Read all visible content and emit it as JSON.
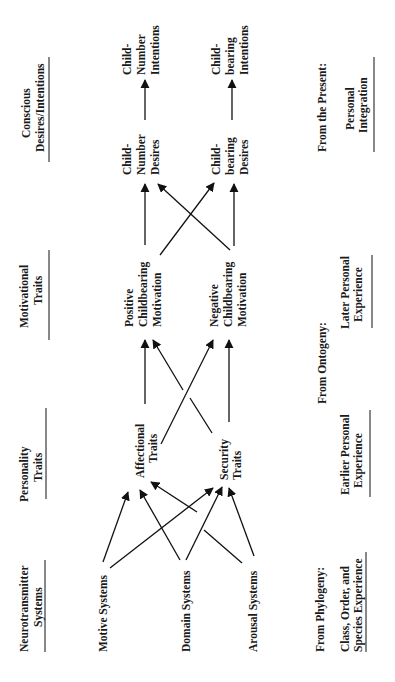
{
  "headers": {
    "neuro": [
      "Neurotransmitter",
      "Systems"
    ],
    "personality": [
      "Personality",
      "Traits"
    ],
    "motivational": [
      "Motivational",
      "Traits"
    ],
    "conscious": [
      "Conscious",
      "Desires/Intentions"
    ]
  },
  "nodes": {
    "motive": [
      "Motive Systems"
    ],
    "domain": [
      "Domain Systems"
    ],
    "arousal": [
      "Arousal Systems"
    ],
    "affectional": [
      "Affectional",
      "Traits"
    ],
    "security": [
      "Security",
      "Traits"
    ],
    "positive": [
      "Positive",
      "Childbearing",
      "Motivation"
    ],
    "negative": [
      "Negative",
      "Childbearing",
      "Motivation"
    ],
    "cn_desires": [
      "Child-",
      "Number",
      "Desires"
    ],
    "cn_intentions": [
      "Child-",
      "Number",
      "Intentions"
    ],
    "cb_desires": [
      "Child-",
      "bearing",
      "Desires"
    ],
    "cb_intentions": [
      "Child-",
      "bearing",
      "Intentions"
    ]
  },
  "sources": {
    "phylogeny_label": "From Phylogeny:",
    "phylogeny": [
      "Class, Order, and",
      "Species Experience"
    ],
    "ontogeny_label": "From Ontogeny:",
    "earlier": [
      "Earlier Personal",
      "Experience"
    ],
    "later": [
      "Later Personal",
      "Experience"
    ],
    "present_label": "From the Present:",
    "present": [
      "Personal",
      "Integration"
    ]
  },
  "edges": [
    [
      "motive",
      "affectional"
    ],
    [
      "motive",
      "security"
    ],
    [
      "domain",
      "affectional"
    ],
    [
      "domain",
      "affectional"
    ],
    [
      "domain",
      "security"
    ],
    [
      "arousal",
      "affectional"
    ],
    [
      "arousal",
      "security"
    ],
    [
      "arousal",
      "security"
    ],
    [
      "affectional",
      "positive"
    ],
    [
      "affectional",
      "negative"
    ],
    [
      "security",
      "positive"
    ],
    [
      "security",
      "negative"
    ],
    [
      "positive",
      "cn_desires"
    ],
    [
      "positive",
      "cb_desires"
    ],
    [
      "negative",
      "cn_desires"
    ],
    [
      "negative",
      "cb_desires"
    ],
    [
      "cn_desires",
      "cn_intentions"
    ],
    [
      "cb_desires",
      "cb_intentions"
    ]
  ]
}
